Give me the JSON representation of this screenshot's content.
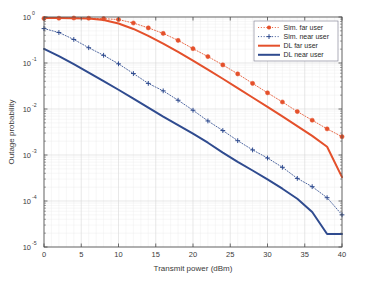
{
  "chart_data": {
    "type": "line",
    "title": "",
    "xlabel": "Transmit power (dBm)",
    "ylabel": "Outage probability",
    "xlim": [
      0,
      40
    ],
    "ylim": [
      1e-05,
      1
    ],
    "yscale": "log",
    "xscale": "linear",
    "grid": true,
    "minor_grid": true,
    "legend_position": "upper right",
    "xticks": [
      0,
      5,
      10,
      15,
      20,
      25,
      30,
      35,
      40
    ],
    "xticklabels": [
      "0",
      "5",
      "10",
      "15",
      "20",
      "25",
      "30",
      "35",
      "40"
    ],
    "yticks": [
      1,
      0.1,
      0.01,
      0.001,
      0.0001,
      1e-05
    ],
    "yticklabels": [
      "10^0",
      "10^-1",
      "10^-2",
      "10^-3",
      "10^-4",
      "10^-5"
    ],
    "ytick_bases": [
      "10",
      "10",
      "10",
      "10",
      "10",
      "10"
    ],
    "ytick_exponents": [
      "0",
      "-1",
      "-2",
      "-3",
      "-4",
      "-5"
    ],
    "series": [
      {
        "name": "Sim. far user",
        "style": "dotted",
        "marker": "circle",
        "color": "#E4502B",
        "x": [
          0,
          2,
          4,
          6,
          8,
          10,
          12,
          14,
          16,
          18,
          20,
          22,
          24,
          26,
          28,
          30,
          32,
          34,
          36,
          38,
          40
        ],
        "y": [
          0.93,
          0.94,
          0.95,
          0.94,
          0.92,
          0.88,
          0.74,
          0.58,
          0.44,
          0.31,
          0.205,
          0.138,
          0.091,
          0.058,
          0.036,
          0.0225,
          0.0142,
          0.0088,
          0.0057,
          0.0037,
          0.0025
        ]
      },
      {
        "name": "Sim. near user",
        "style": "dotted",
        "marker": "plus",
        "color": "#2F4B8F",
        "x": [
          0,
          2,
          4,
          6,
          8,
          10,
          12,
          14,
          16,
          18,
          20,
          22,
          24,
          26,
          28,
          30,
          32,
          34,
          36,
          38,
          40
        ],
        "y": [
          0.56,
          0.46,
          0.325,
          0.215,
          0.147,
          0.096,
          0.059,
          0.036,
          0.0248,
          0.0155,
          0.0094,
          0.0055,
          0.0034,
          0.00205,
          0.00129,
          0.00086,
          0.00054,
          0.00031,
          0.000205,
          0.000118,
          5e-05
        ]
      },
      {
        "name": "DL far user",
        "style": "solid",
        "marker": "none",
        "color": "#E4502B",
        "x": [
          0,
          2,
          4,
          6,
          8,
          10,
          12,
          14,
          16,
          18,
          20,
          22,
          24,
          26,
          28,
          30,
          32,
          34,
          36,
          38,
          40
        ],
        "y": [
          0.95,
          0.95,
          0.945,
          0.93,
          0.86,
          0.72,
          0.55,
          0.39,
          0.265,
          0.175,
          0.113,
          0.072,
          0.0455,
          0.0285,
          0.0178,
          0.0111,
          0.0069,
          0.00425,
          0.0026,
          0.00151,
          0.00033
        ]
      },
      {
        "name": "DL near user",
        "style": "solid",
        "marker": "none",
        "color": "#2F4B8F",
        "x": [
          0,
          2,
          4,
          6,
          8,
          10,
          12,
          14,
          16,
          18,
          20,
          22,
          24,
          26,
          28,
          30,
          32,
          34,
          36,
          38,
          40
        ],
        "y": [
          0.202,
          0.141,
          0.094,
          0.062,
          0.0405,
          0.0262,
          0.0168,
          0.0107,
          0.0068,
          0.00445,
          0.0029,
          0.00185,
          0.00113,
          0.00071,
          0.00046,
          0.000295,
          0.000185,
          0.000112,
          5.75e-05,
          1.92e-05,
          1.92e-05
        ]
      }
    ]
  },
  "legend": {
    "items": [
      {
        "label": "Sim. far user"
      },
      {
        "label": "Sim. near user"
      },
      {
        "label": "DL far user"
      },
      {
        "label": "DL near user"
      }
    ]
  },
  "colors": {
    "red": "#E4502B",
    "blue": "#2F4B8F",
    "grid": "#d8d8d8",
    "minor_grid": "#ececec",
    "axis": "#4d4d4d",
    "text": "#3a3a3a",
    "background": "#ffffff"
  }
}
